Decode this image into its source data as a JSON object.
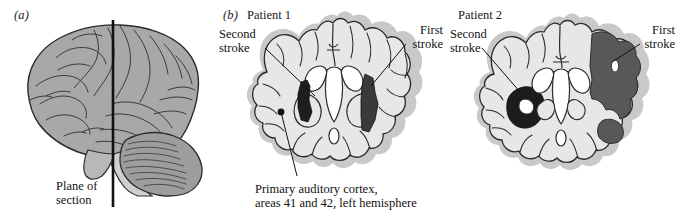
{
  "figure": {
    "type": "anatomical-illustration",
    "background_color": "#ffffff"
  },
  "colors": {
    "brain_lateral_fill": "#a8a8a8",
    "section_fill": "#e7e7e7",
    "section_outer_band": "#c9c9c9",
    "ventricle_fill": "#ffffff",
    "lesion_first_stroke_p1": "#3a3a3a",
    "lesion_second_stroke_p1": "#1e1e1e",
    "lesion_first_stroke_p2": "#585858",
    "lesion_second_stroke_p2": "#1c1c1c",
    "outline": "#2b2b2b",
    "leader_line": "#1a1a1a",
    "text": "#111111"
  },
  "panel_a": {
    "label": "(a)",
    "plane_line_label_line1": "Plane of",
    "plane_line_label_line2": "section",
    "icon_names": {
      "brain": "brain-lateral-icon",
      "cerebellum": "cerebellum-icon",
      "brainstem": "brainstem-icon",
      "plane_line": "plane-of-section-line"
    }
  },
  "panel_b": {
    "label": "(b)",
    "title": "Patient 1",
    "second_stroke_line1": "Second",
    "second_stroke_line2": "stroke",
    "first_stroke_line1": "First",
    "first_stroke_line2": "stroke",
    "caption_line1": "Primary auditory cortex,",
    "caption_line2": "areas 41 and 42, left hemisphere",
    "icon_names": {
      "section": "coronal-section-patient-1",
      "ventricles": "lateral-ventricles-icon",
      "lesion_first": "lesion-first-stroke-icon",
      "lesion_second": "lesion-second-stroke-icon",
      "marker_dot": "auditory-cortex-marker-dot"
    }
  },
  "panel_c": {
    "title": "Patient 2",
    "second_stroke_line1": "Second",
    "second_stroke_line2": "stroke",
    "first_stroke_line1": "First",
    "first_stroke_line2": "stroke",
    "icon_names": {
      "section": "coronal-section-patient-2",
      "ventricles": "lateral-ventricles-icon",
      "lesion_first": "lesion-first-stroke-icon",
      "lesion_second": "lesion-second-stroke-icon"
    }
  }
}
